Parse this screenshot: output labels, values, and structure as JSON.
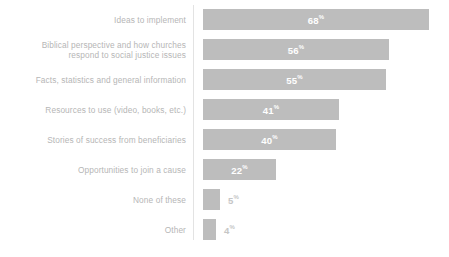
{
  "chart_data": {
    "type": "bar",
    "orientation": "horizontal",
    "title": "",
    "subtitle": "",
    "xlabel": "",
    "ylabel": "",
    "xlim": [
      0,
      68
    ],
    "grid": false,
    "legend": false,
    "value_suffix": "%",
    "categories": [
      "Ideas to implement",
      "Biblical perspective and how churches\nrespond to social justice issues",
      "Facts, statistics and general information",
      "Resources to use (video, books, etc.)",
      "Stories of success from beneficiaries",
      "Opportunities to join a cause",
      "None of these",
      "Other"
    ],
    "values": [
      68,
      56,
      55,
      41,
      40,
      22,
      5,
      4
    ],
    "value_labels": [
      "68",
      "56",
      "55",
      "41",
      "40",
      "22",
      "5",
      "4"
    ],
    "label_placement": [
      "inside",
      "inside",
      "inside",
      "inside",
      "inside",
      "inside",
      "outside",
      "outside"
    ],
    "colors": {
      "bar": "#bdbdbd",
      "category_label": "#b6b6b6",
      "value_inside": "#ffffff",
      "value_outside": "#c6c6c6",
      "axis_line": "#e3e3e3",
      "background": "#ffffff"
    }
  }
}
